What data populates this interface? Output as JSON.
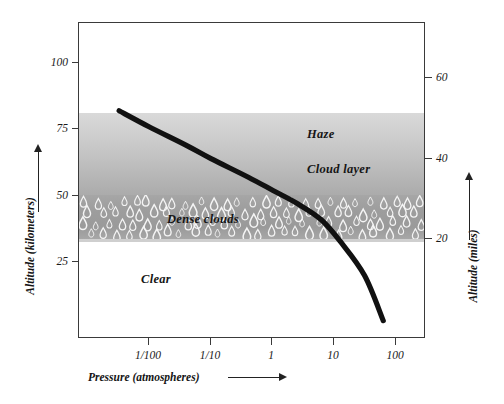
{
  "figure": {
    "left_axis_title": "Altitude (kilometers)",
    "right_axis_title": "Altitude (miles)",
    "bottom_axis_title": "Pressure (atmospheres)"
  },
  "bands": {
    "haze": "Haze",
    "cloud_layer": "Cloud layer",
    "dense_clouds": "Dense clouds",
    "clear": "Clear"
  },
  "chart_data": {
    "type": "line",
    "title": "",
    "xlabel": "Pressure (atmospheres)",
    "ylabel": "Altitude (kilometers)",
    "y2label": "Altitude (miles)",
    "xscale": "log",
    "grid": false,
    "legend": null,
    "xlim": [
      0.0017,
      300
    ],
    "ylim": [
      0,
      113
    ],
    "y2lim": [
      0,
      70
    ],
    "xticklabels": [
      "1/100",
      "1/10",
      "1",
      "10",
      "100"
    ],
    "xtickvalues": [
      0.01,
      0.1,
      1,
      10,
      100
    ],
    "yticklabels": [
      "100",
      "75",
      "50",
      "25"
    ],
    "ytickvalues": [
      100,
      75,
      50,
      25
    ],
    "y2ticklabels": [
      "60",
      "40",
      "20"
    ],
    "y2tickvalues": [
      60,
      40,
      20
    ],
    "series": [
      {
        "name": "Temperature / pressure profile",
        "x": [
          0.0033,
          0.01,
          0.04,
          0.1,
          0.4,
          1,
          2.5,
          6,
          12,
          30,
          60
        ],
        "y": [
          82,
          76,
          69,
          64,
          57,
          52,
          47,
          41,
          33,
          20,
          3
        ]
      }
    ],
    "annotations": [
      {
        "text": "Haze",
        "x": 18,
        "y": 68
      },
      {
        "text": "Cloud layer",
        "x": 18,
        "y": 55
      },
      {
        "text": "Dense clouds",
        "x": 0.03,
        "y": 48
      },
      {
        "text": "Clear",
        "x": 0.007,
        "y": 30
      }
    ],
    "regions": [
      {
        "label": "Haze",
        "y_top": 68,
        "y_bottom": 58
      },
      {
        "label": "Cloud layer",
        "y_top": 58,
        "y_bottom": 50
      },
      {
        "label": "Dense clouds",
        "y_top": 50,
        "y_bottom": 33
      },
      {
        "label": "Clear",
        "y_top": 33,
        "y_bottom": 0
      }
    ]
  },
  "axes": {
    "left_ticks": [
      {
        "label": "100",
        "top": 56
      },
      {
        "label": "75",
        "top": 122
      },
      {
        "label": "50",
        "top": 189
      },
      {
        "label": "25",
        "top": 255
      }
    ],
    "right_ticks": [
      {
        "label": "60",
        "top": 71
      },
      {
        "label": "40",
        "top": 152
      },
      {
        "label": "20",
        "top": 232
      }
    ],
    "bottom_ticks": [
      {
        "label": "1/100",
        "left": 148
      },
      {
        "label": "1/10",
        "left": 210
      },
      {
        "label": "1",
        "left": 271
      },
      {
        "label": "10",
        "left": 333
      },
      {
        "label": "100",
        "left": 395
      }
    ]
  },
  "colors": {
    "frame": "#3a3a3a",
    "curve": "#111111",
    "haze_top": "#d9d9d9",
    "cloud_bottom": "#ababab",
    "dense_cloud": "#9d9d9d",
    "droplet": "#f2f2f2",
    "text": "#151515"
  }
}
